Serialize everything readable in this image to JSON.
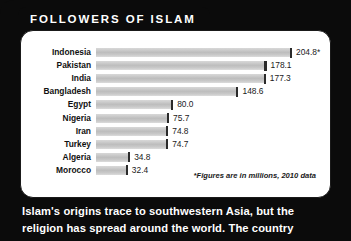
{
  "title": "FOLLOWERS OF ISLAM",
  "footnote": "*Figures are in millions, 2010 data",
  "caption": {
    "line1": "Islam's origins trace to southwestern Asia, but the",
    "line2": "religion has spread around the world. The country"
  },
  "colors": {
    "frame": "#0b0b0b",
    "panel": "#ffffff",
    "bar": "#c4c4c4",
    "bar_cap": "#2b2b2b",
    "text": "#111111",
    "title_text": "#ffffff"
  },
  "chart_data": {
    "type": "bar",
    "title": "FOLLOWERS OF ISLAM",
    "xlabel": "",
    "ylabel": "",
    "orientation": "horizontal",
    "grid": false,
    "legend": "none",
    "note": "*Figures are in millions, 2010 data",
    "xlim": [
      0,
      204.8
    ],
    "categories": [
      "Indonesia",
      "Pakistan",
      "India",
      "Bangladesh",
      "Egypt",
      "Nigeria",
      "Iran",
      "Turkey",
      "Algeria",
      "Morocco"
    ],
    "values": [
      204.8,
      178.1,
      177.3,
      148.6,
      80.0,
      75.7,
      74.8,
      74.7,
      34.8,
      32.4
    ],
    "value_labels": [
      "204.8*",
      "178.1",
      "177.3",
      "148.6",
      "80.0",
      "75.7",
      "74.8",
      "74.7",
      "34.8",
      "32.4"
    ]
  }
}
